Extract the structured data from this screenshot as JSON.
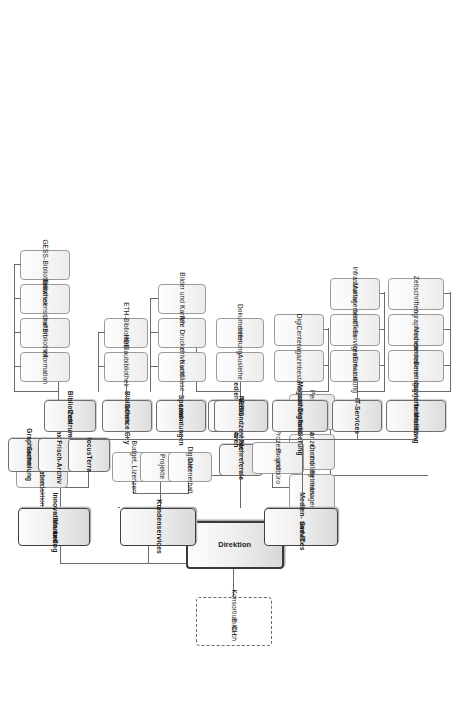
{
  "chart": {
    "orientation": "rotated-90",
    "root": {
      "label": "Direktion"
    },
    "external_partner": {
      "label": "Konsortium CH\nE-lib.ch",
      "line1": "Konsortium CH",
      "line2": "E-lib.ch"
    },
    "director_staff": [
      {
        "line1": "Betriebs-",
        "line2": "management"
      },
      {
        "line1": "Finanzen und",
        "line2": "Controlling"
      },
      {
        "line1": "Personaldienst",
        "line2": ""
      }
    ],
    "departments": [
      {
        "id": "innovation",
        "line1": "Innovation und",
        "line2": "Marketing",
        "staff": [
          {
            "line1": "Kommunikation",
            "line2": "und Webredaktion"
          }
        ],
        "children": [
          {
            "line1": "Graphische",
            "line2": "Sammlung",
            "children": []
          },
          {
            "line1": "Max Frisch-Archiv",
            "line2": "",
            "children": []
          },
          {
            "line1": "focusTerra",
            "line2": "",
            "children": []
          }
        ]
      },
      {
        "id": "kundenservices",
        "line1": "Kundenservices",
        "line2": "",
        "staff": [
          {
            "line1": "Budget, Lizenzen",
            "line2": ""
          },
          {
            "line1": "Projekte",
            "line2": ""
          },
          {
            "line1": "Digitaler",
            "line2": "Datenerhalt"
          }
        ],
        "children": [
          {
            "line1": "Fachreferate",
            "line2": "",
            "children": []
          },
          {
            "line1": "Mediendistribution",
            "line2": "und Gebühren",
            "children": [
              {
                "line1": "Ausleihe",
                "line2": ""
              },
              {
                "line1": "Dokumenten-",
                "line2": "lieferung"
              }
            ]
          },
          {
            "line1": "Spezial-",
            "line2": "sammlungen",
            "children": [
              {
                "line1": "Archive und",
                "line2": "Nachlässe"
              },
              {
                "line1": "Alte Drucke",
                "line2": ""
              },
              {
                "line1": "Bilder und Karten",
                "line2": ""
              }
            ]
          },
          {
            "line1": "Bibliothek",
            "line2": "Science City",
            "children": [
              {
                "line1": "Baubibliothek",
                "line2": ""
              },
              {
                "line1": "ETH-Bibliothek",
                "line2": "HDB"
              }
            ]
          },
          {
            "line1": "Bibliothek",
            "line2": "Zentrum",
            "children": [
              {
                "line1": "Information",
                "line2": ""
              },
              {
                "line1": "Grüne Bibliothek",
                "line2": ""
              },
              {
                "line1": "Bibliothek",
                "line2": "Erdwissenschaften"
              },
              {
                "line1": "GESS-Bibliothek",
                "line2": ""
              }
            ]
          }
        ]
      },
      {
        "id": "medien-it",
        "line1": "Medien- und IT-",
        "line2": "Services",
        "staff": [
          {
            "line1": "Prozess- und",
            "line2": "Projektbüro"
          }
        ],
        "children": [
          {
            "line1": "Integrierte Medien-",
            "line2": "bearbeitung",
            "children": [
              {
                "line1": "Bestandes-",
                "line2": "übernahmen und",
                "line3": "Bereinigungen"
              },
              {
                "line1": "Monographische",
                "line2": "Medien"
              },
              {
                "line1": "Zeitschriften",
                "line2": ""
              }
            ]
          },
          {
            "line1": "IT-Services",
            "line2": "",
            "children": [
              {
                "line1": "Integration und",
                "line2": "Entwicklung"
              },
              {
                "line1": "Bibliotheks-",
                "line2": "IT-Services"
              },
              {
                "line1": "Infrastruktur-",
                "line2": "Management"
              }
            ]
          },
          {
            "line1": "Magazinbestand",
            "line2": "und Digitalisierung",
            "children": [
              {
                "line1": "Magazinbestand",
                "line2": ""
              },
              {
                "line1": "DigiCenter",
                "line2": ""
              }
            ]
          },
          {
            "line1": "NEBIS-",
            "line2": "Verbundzentrale",
            "children": []
          }
        ]
      }
    ]
  }
}
